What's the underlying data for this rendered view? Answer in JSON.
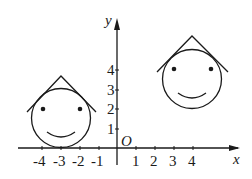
{
  "axes": {
    "x_label": "x",
    "y_label": "y",
    "origin_label": "O",
    "x_ticks": [
      {
        "label": "-4",
        "x": 42
      },
      {
        "label": "-3",
        "x": 61
      },
      {
        "label": "-2",
        "x": 80
      },
      {
        "label": "-1",
        "x": 99
      },
      {
        "label": "1",
        "x": 136
      },
      {
        "label": "2",
        "x": 155
      },
      {
        "label": "3",
        "x": 174
      },
      {
        "label": "4",
        "x": 193
      }
    ],
    "y_ticks": [
      {
        "label": "1",
        "y": 129
      },
      {
        "label": "2",
        "y": 109
      },
      {
        "label": "3",
        "y": 90
      },
      {
        "label": "4",
        "y": 70
      }
    ]
  },
  "figures": [
    {
      "name": "left-face",
      "center": [
        -3,
        1.5
      ],
      "description": "smiley face with triangular hat touching x-axis"
    },
    {
      "name": "right-face",
      "center": [
        4,
        3.5
      ],
      "description": "smiley face with triangular hat, translated copy"
    }
  ],
  "colors": {
    "ink": "#1a1a1a",
    "background": "#ffffff"
  }
}
